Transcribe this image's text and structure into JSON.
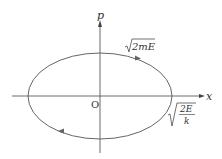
{
  "diagram": {
    "type": "phase-space-ellipse",
    "axes": {
      "horizontal_label": "x",
      "vertical_label": "p",
      "origin_label": "O"
    },
    "ellipse": {
      "top_intercept_label": "2mE",
      "right_intercept_numerator": "2E",
      "right_intercept_denominator": "k",
      "direction": "clockwise"
    },
    "colors": {
      "axis": "#444444",
      "curve": "#666666",
      "text": "#333333"
    }
  }
}
